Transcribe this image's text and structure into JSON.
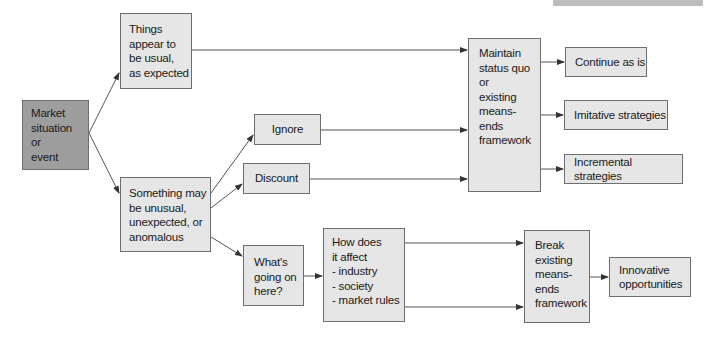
{
  "diagram": {
    "nodes": {
      "market": "Market\nsituation\nor\nevent",
      "usual": "Things\nappear to\nbe usual,\nas expected",
      "unusual": "Something may\nbe unusual,\nunexpected, or\nanomalous",
      "ignore": "Ignore",
      "discount": "Discount",
      "whats": "What's\ngoing on\nhere?",
      "how": "How does\nit affect\n- industry\n- society\n- market rules",
      "maintain": "Maintain\nstatus quo\nor\nexisting\nmeans-ends\nframework",
      "continue": "Continue as is",
      "imitative": "Imitative strategies",
      "incremental": "Incremental strategies",
      "break": "Break\nexisting\nmeans-\nends\nframework",
      "innovative": "Innovative\nopportunities"
    },
    "edges": [
      {
        "from": "market",
        "to": "usual"
      },
      {
        "from": "market",
        "to": "unusual"
      },
      {
        "from": "usual",
        "to": "maintain"
      },
      {
        "from": "unusual",
        "to": "ignore"
      },
      {
        "from": "unusual",
        "to": "discount"
      },
      {
        "from": "unusual",
        "to": "whats"
      },
      {
        "from": "ignore",
        "to": "maintain"
      },
      {
        "from": "discount",
        "to": "maintain"
      },
      {
        "from": "whats",
        "to": "how"
      },
      {
        "from": "how",
        "to": "break"
      },
      {
        "from": "how",
        "to": "break"
      },
      {
        "from": "maintain",
        "to": "continue"
      },
      {
        "from": "maintain",
        "to": "imitative"
      },
      {
        "from": "maintain",
        "to": "incremental"
      },
      {
        "from": "break",
        "to": "innovative"
      }
    ],
    "colors": {
      "highlight_fill": "#9e9e9e",
      "box_fill": "#e6e6e6",
      "stroke": "#555555"
    }
  }
}
